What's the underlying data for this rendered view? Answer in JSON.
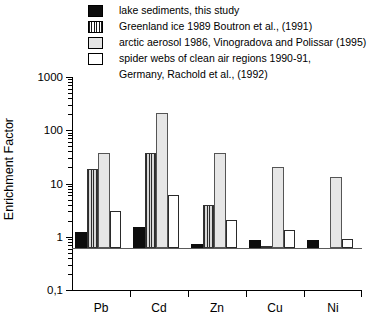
{
  "legend": {
    "items": [
      {
        "swatch": "solid-black",
        "label": "lake sediments, this study"
      },
      {
        "swatch": "vertical-striped",
        "label": "Greenland ice 1989 Boutron et al., (1991)"
      },
      {
        "swatch": "light-gray",
        "label": "arctic aerosol 1986, Vinogradova and Polissar (1995)"
      },
      {
        "swatch": "white",
        "label": "spider webs of clean air regions 1990-91,"
      }
    ],
    "continuation": "Germany, Rachold et al.,  (1992)"
  },
  "axes": {
    "y_title": "Enrichment Factor",
    "y_ticks": [
      "1000",
      "100",
      "10",
      "1",
      "0,1"
    ],
    "x_ticks": [
      "Pb",
      "Cd",
      "Zn",
      "Cu",
      "Ni"
    ]
  },
  "chart_data": {
    "type": "bar",
    "title": "",
    "xlabel": "",
    "ylabel": "Enrichment Factor",
    "yscale": "log",
    "ylim": [
      0.1,
      1000
    ],
    "ytick_labels": [
      "0,1",
      "1",
      "10",
      "100",
      "1000"
    ],
    "grid": false,
    "legend_position": "above-plot",
    "categories": [
      "Pb",
      "Cd",
      "Zn",
      "Cu",
      "Ni"
    ],
    "series": [
      {
        "name": "lake sediments, this study",
        "fill": "solid-black",
        "color": "#0d0d0d",
        "values": [
          2.0,
          2.5,
          1.2,
          1.4,
          1.4
        ]
      },
      {
        "name": "Greenland ice 1989 Boutron et al., (1991)",
        "fill": "vertical-striped",
        "color": "#2b2b2b",
        "values": [
          30,
          60,
          6.5,
          1.1,
          null
        ]
      },
      {
        "name": "arctic aerosol 1986, Vinogradova and Polissar (1995)",
        "fill": "light-gray",
        "color": "#e6e6e6",
        "values": [
          60,
          350,
          60,
          33,
          22
        ]
      },
      {
        "name": "spider webs of clean air regions 1990-91, Germany, Rachold et al., (1992)",
        "fill": "white",
        "color": "#ffffff",
        "values": [
          5.0,
          10,
          3.3,
          2.2,
          1.5
        ]
      }
    ]
  }
}
